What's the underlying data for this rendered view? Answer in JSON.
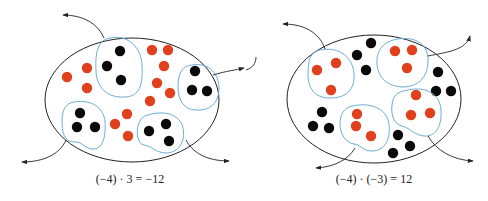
{
  "colors": {
    "background": "#ffffff",
    "outline": "#222222",
    "group_outline": "#6aaed6",
    "negative_counter": "#e0401c",
    "positive_counter": "#0a0a0a"
  },
  "diagrams": [
    {
      "id": "left",
      "caption": "(−4) · 3 = −12",
      "caption_pos": [
        130,
        172
      ],
      "ellipse": {
        "cx": 132,
        "cy": 100,
        "rx": 87,
        "ry": 62
      },
      "groups": [
        {
          "name": "group-top",
          "path": "M 110 38 C 128 34 142 48 142 66 C 143 84 140 97 124 97 C 106 98 96 86 96 70 C 95 52 98 40 110 38 Z",
          "counters": [
            [
              120,
              51
            ],
            [
              107,
              66
            ],
            [
              121,
              80
            ]
          ],
          "color": "positive"
        },
        {
          "name": "group-right",
          "path": "M 192 65 C 210 62 219 75 219 88 C 219 103 210 111 196 110 C 184 110 178 100 178 87 C 178 73 182 66 192 65 Z",
          "counters": [
            [
              195,
              71
            ],
            [
              192,
              90
            ],
            [
              207,
              91
            ]
          ],
          "color": "positive"
        },
        {
          "name": "group-bottom-left",
          "path": "M 74 102 C 92 99 104 108 105 122 C 106 136 103 150 92 149 C 84 148 82 141 74 142 C 64 142 62 132 62 120 C 62 110 66 103 74 102 Z",
          "counters": [
            [
              80,
              113
            ],
            [
              77,
              127
            ],
            [
              95,
              127
            ]
          ],
          "color": "positive"
        },
        {
          "name": "group-bottom-right",
          "path": "M 148 115 C 164 110 180 114 183 128 C 186 142 178 153 166 153 C 156 153 152 146 144 145 C 138 144 136 134 138 126 C 140 119 143 116 148 115 Z",
          "counters": [
            [
              166,
              124
            ],
            [
              149,
              131
            ],
            [
              169,
              141
            ]
          ],
          "color": "positive"
        }
      ],
      "loose_counters": {
        "color": "negative",
        "points": [
          [
            152,
            50
          ],
          [
            168,
            50
          ],
          [
            164,
            66
          ],
          [
            87,
            68
          ],
          [
            67,
            77
          ],
          [
            87,
            88
          ],
          [
            157,
            83
          ],
          [
            170,
            93
          ],
          [
            150,
            101
          ],
          [
            127,
            114
          ],
          [
            115,
            124
          ],
          [
            128,
            136
          ]
        ]
      },
      "arrows": [
        {
          "name": "arrow-remove-top",
          "path": "M 104 38 C 98 24 84 15 63 15"
        },
        {
          "name": "arrow-remove-right",
          "path": "M 213 75 C 226 71 236 70 244 68"
        },
        {
          "name": "arrow-remove-bottom-left",
          "path": "M 66 140 C 60 154 44 162 22 162"
        },
        {
          "name": "arrow-remove-bottom-right",
          "path": "M 186 140 C 192 152 206 161 229 161"
        }
      ]
    },
    {
      "id": "right",
      "caption": "(−4) · (−3) = 12",
      "caption_pos": [
        374,
        172
      ],
      "ellipse": {
        "cx": 374,
        "cy": 99,
        "rx": 87,
        "ry": 64
      },
      "groups": [
        {
          "name": "group-top-left",
          "path": "M 320 50 C 340 46 353 58 354 74 C 355 90 346 98 330 98 C 314 98 308 88 308 74 C 308 60 310 52 320 50 Z",
          "counters": [
            [
              317,
              70
            ],
            [
              336,
              63
            ],
            [
              331,
              90
            ]
          ],
          "color": "negative"
        },
        {
          "name": "group-top-right",
          "path": "M 398 39 C 418 36 428 46 428 60 C 428 76 420 86 404 87 C 388 87 378 78 377 64 C 376 50 384 41 398 39 Z",
          "counters": [
            [
              395,
              51
            ],
            [
              412,
              50
            ],
            [
              407,
              68
            ]
          ],
          "color": "negative"
        },
        {
          "name": "group-bottom-right",
          "path": "M 408 90 C 426 86 440 94 441 110 C 442 126 436 137 424 136 C 414 135 410 128 402 126 C 392 124 390 110 393 100 C 395 94 400 91 408 90 Z",
          "counters": [
            [
              416,
              95
            ],
            [
              411,
              115
            ],
            [
              430,
              113
            ]
          ],
          "color": "negative"
        },
        {
          "name": "group-bottom-middle",
          "path": "M 352 106 C 370 102 387 108 389 124 C 391 140 384 151 372 151 C 362 151 360 144 354 144 C 346 143 340 134 340 124 C 340 114 344 108 352 106 Z",
          "counters": [
            [
              357,
              114
            ],
            [
              356,
              126
            ],
            [
              371,
              136
            ]
          ],
          "color": "negative"
        }
      ],
      "loose_counters": {
        "color": "positive",
        "points": [
          [
            371,
            43
          ],
          [
            357,
            55
          ],
          [
            366,
            70
          ],
          [
            438,
            72
          ],
          [
            436,
            91
          ],
          [
            451,
            91
          ],
          [
            322,
            112
          ],
          [
            313,
            126
          ],
          [
            329,
            128
          ],
          [
            398,
            135
          ],
          [
            410,
            146
          ],
          [
            393,
            153
          ]
        ]
      },
      "arrows": [
        {
          "name": "arrow-remove-top-left",
          "path": "M 325 49 C 320 34 306 24 283 24"
        },
        {
          "name": "arrow-remove-top-right",
          "path": "M 428 56 C 448 52 466 50 470 36"
        },
        {
          "name": "arrow-remove-bottom-middle",
          "path": "M 355 148 C 348 160 334 167 316 168"
        },
        {
          "name": "arrow-remove-bottom-right",
          "path": "M 428 136 C 436 150 452 160 473 161"
        }
      ],
      "extra_strokes": [
        {
          "name": "stray-curve-left",
          "path": "M 256 57 C 256 64 252 68 246 70"
        }
      ]
    }
  ]
}
